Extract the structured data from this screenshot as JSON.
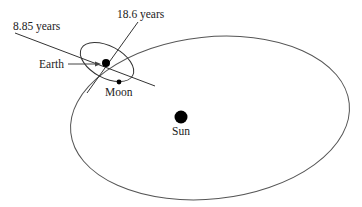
{
  "diagram": {
    "labels": {
      "period_1": "8.85 years",
      "period_2": "18.6 years",
      "earth": "Earth",
      "moon": "Moon",
      "sun": "Sun"
    },
    "colors": {
      "stroke": "#333333",
      "bodies": "#000000",
      "text": "#222222"
    }
  }
}
